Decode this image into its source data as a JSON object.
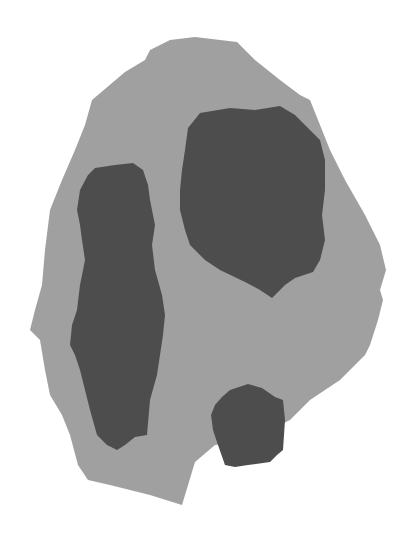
{
  "figure": {
    "width": 413,
    "height": 544,
    "background": "#ffffff",
    "outer_region": {
      "label": "outer-blob",
      "color": "#a0a0a0",
      "points": "170,40 195,37 237,42 255,60 280,80 300,95 310,100 330,150 345,180 365,215 380,245 386,270 380,290 383,300 378,320 370,345 365,355 340,380 310,400 290,420 250,440 215,445 195,462 182,505 150,495 110,485 88,480 78,465 70,435 62,415 50,395 45,370 40,340 30,330 35,310 42,285 45,250 50,210 62,180 75,150 85,125 92,100 125,72 145,60 150,50"
    },
    "inner_regions": [
      {
        "label": "top-right-blob",
        "color": "#4d4d4d",
        "points": "200,113 230,108 255,110 280,106 295,115 310,130 320,140 325,160 325,190 322,215 325,240 320,260 313,272 295,278 285,285 272,298 260,290 245,282 220,270 205,260 190,245 185,230 180,210 180,190 182,170 185,150 188,128"
      },
      {
        "label": "left-vertical-blob",
        "color": "#4d4d4d",
        "points": "95,168 115,165 133,163 143,170 148,185 150,200 155,225 152,245 155,270 162,295 165,315 163,335 160,355 157,375 150,400 147,435 135,437 125,445 117,450 107,445 97,435 90,410 85,390 80,370 75,355 70,345 72,325 77,310 80,285 85,260 82,240 80,225 77,210 80,190 88,175"
      },
      {
        "label": "bottom-small-blob",
        "color": "#4d4d4d",
        "points": "230,390 248,384 262,388 275,397 283,400 285,420 283,450 277,455 270,462 248,465 235,467 225,465 218,445 213,430 211,415 215,405 222,397"
      }
    ]
  }
}
